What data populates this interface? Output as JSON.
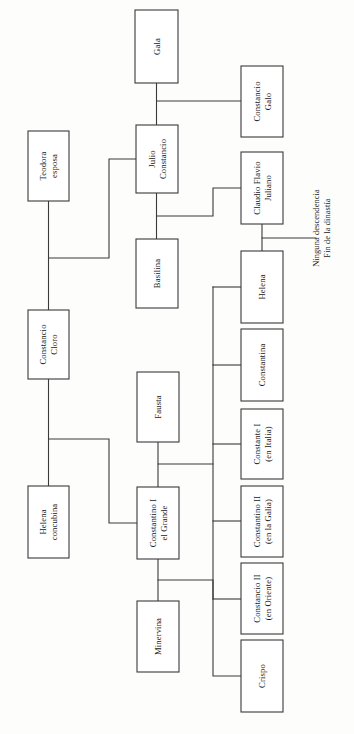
{
  "diagram": {
    "type": "genealogy-tree",
    "title": "",
    "orientation": "rotated-90-clockwise",
    "stroke_color": "#3a3a3a",
    "box_fill": "#ffffff",
    "text_color": "#171717",
    "background": "#fdfdfc",
    "nodes": [
      {
        "id": "gala",
        "lines": [
          "Gala"
        ],
        "x": 135,
        "y": 10,
        "w": 43,
        "h": 73
      },
      {
        "id": "constancio-galo",
        "lines": [
          "Constancio",
          "Galo"
        ],
        "x": 241,
        "y": 66,
        "w": 42,
        "h": 71
      },
      {
        "id": "teodora-esposa",
        "lines": [
          "Teodora",
          "esposa"
        ],
        "x": 28,
        "y": 131,
        "w": 41,
        "h": 70
      },
      {
        "id": "julio-constancio",
        "lines": [
          "Julio",
          "Constancio"
        ],
        "x": 136,
        "y": 125,
        "w": 42,
        "h": 68
      },
      {
        "id": "claudio-flavio-juliano",
        "lines": [
          "Claudio Flavio",
          "Juliano"
        ],
        "x": 241,
        "y": 152,
        "w": 42,
        "h": 72
      },
      {
        "id": "basilina",
        "lines": [
          "Basilina"
        ],
        "x": 136,
        "y": 239,
        "w": 42,
        "h": 69
      },
      {
        "id": "helena-hija",
        "lines": [
          "Helena"
        ],
        "x": 241,
        "y": 251,
        "w": 42,
        "h": 72
      },
      {
        "id": "constancio-cloro",
        "lines": [
          "Constancio",
          "Cloro"
        ],
        "x": 28,
        "y": 310,
        "w": 41,
        "h": 69
      },
      {
        "id": "constantina",
        "lines": [
          "Constantina"
        ],
        "x": 241,
        "y": 329,
        "w": 42,
        "h": 72
      },
      {
        "id": "fausta",
        "lines": [
          "Fausta"
        ],
        "x": 137,
        "y": 372,
        "w": 42,
        "h": 70
      },
      {
        "id": "constante-i",
        "lines": [
          "Constante I",
          "(en Italia)"
        ],
        "x": 241,
        "y": 409,
        "w": 42,
        "h": 70
      },
      {
        "id": "helena-concubina",
        "lines": [
          "Helena",
          "concubina"
        ],
        "x": 28,
        "y": 486,
        "w": 41,
        "h": 72
      },
      {
        "id": "constantino-i",
        "lines": [
          "Constantino I",
          "el Grande"
        ],
        "x": 137,
        "y": 487,
        "w": 42,
        "h": 72
      },
      {
        "id": "constantino-ii",
        "lines": [
          "Constantino II",
          "(en la Galia)"
        ],
        "x": 241,
        "y": 486,
        "w": 42,
        "h": 71
      },
      {
        "id": "constancio-ii",
        "lines": [
          "Constancio II",
          "(en Oriente)"
        ],
        "x": 241,
        "y": 563,
        "w": 42,
        "h": 71
      },
      {
        "id": "minervina",
        "lines": [
          "Minervina"
        ],
        "x": 137,
        "y": 601,
        "w": 42,
        "h": 71
      },
      {
        "id": "crispo",
        "lines": [
          "Crispo"
        ],
        "x": 241,
        "y": 640,
        "w": 42,
        "h": 72
      }
    ],
    "annotations": [
      {
        "id": "fin-dinastia",
        "lines": [
          "Ninguna descendencia",
          "Fin de la dinastía"
        ],
        "x": 316,
        "y": 228
      }
    ],
    "connectors": [
      {
        "id": "gala-down",
        "d": "M 156.5 83 L 156.5 125"
      },
      {
        "id": "julio-gala-galo-branch",
        "d": "M 156.5 101 L 241 101"
      },
      {
        "id": "julio-down",
        "d": "M 156.5 193 L 156.5 239"
      },
      {
        "id": "julio-juliano-branch",
        "d": "M 156.5 216 L 213 216 L 213 188 L 241 188"
      },
      {
        "id": "teodora-down",
        "d": "M 48.5 201 L 48.5 310"
      },
      {
        "id": "teodora-julio-branch",
        "d": "M 48.5 258 L 109 258 L 109 159 L 136 159"
      },
      {
        "id": "cloro-down",
        "d": "M 48.5 379 L 48.5 486"
      },
      {
        "id": "cloro-constantino-branch",
        "d": "M 48.5 439 L 109 439 L 109 523 L 137 523"
      },
      {
        "id": "juliano-helena-down",
        "d": "M 262 224 L 262 251"
      },
      {
        "id": "juliano-no-issue",
        "d": "M 262 238 L 316 238"
      },
      {
        "id": "fausta-down",
        "d": "M 158 442 L 158 487"
      },
      {
        "id": "fausta-children-bus",
        "d": "M 158 464 L 213 464"
      },
      {
        "id": "children-bus-vertical",
        "d": "M 213 287 L 213 599"
      },
      {
        "id": "child-helena",
        "d": "M 213 287 L 241 287"
      },
      {
        "id": "child-constantina",
        "d": "M 213 365 L 241 365"
      },
      {
        "id": "child-constante",
        "d": "M 213 444 L 241 444"
      },
      {
        "id": "child-constantino-ii",
        "d": "M 213 521 L 241 521"
      },
      {
        "id": "child-constancio-ii",
        "d": "M 213 599 L 241 599"
      },
      {
        "id": "constantino-down",
        "d": "M 158 559 L 158 601"
      },
      {
        "id": "constantino-crispo-branch",
        "d": "M 158 580 L 213 580 L 213 676 L 241 676"
      }
    ]
  }
}
